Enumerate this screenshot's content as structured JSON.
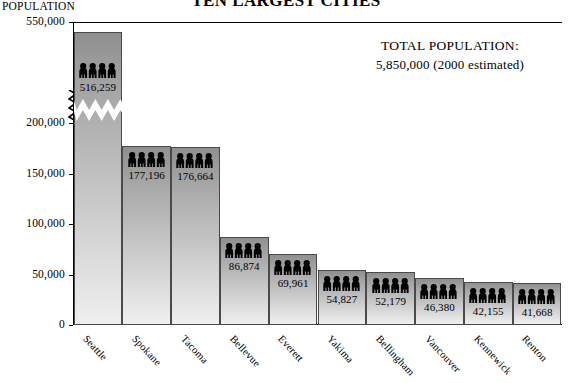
{
  "title": "TEN LARGEST CITIES",
  "axis_title": "POPULATION",
  "callout": {
    "line1": "TOTAL POPULATION:",
    "line2": "5,850,000   (2000 estimated)"
  },
  "icon": {
    "bar_icon_name": "people-group-icon",
    "people_per_bar": 4
  },
  "chart_data": {
    "type": "bar",
    "title": "TEN LARGEST CITIES",
    "xlabel": "",
    "ylabel": "POPULATION",
    "categories": [
      "Seattle",
      "Spokane",
      "Tacoma",
      "Bellevue",
      "Everett",
      "Yakima",
      "Bellingham",
      "Vancouver",
      "Kennewick",
      "Renton"
    ],
    "values": [
      516259,
      177196,
      176664,
      86874,
      69961,
      54827,
      52179,
      46380,
      42155,
      41668
    ],
    "value_labels": [
      "516,259",
      "177,196",
      "176,664",
      "86,874",
      "69,961",
      "54,827",
      "52,179",
      "46,380",
      "42,155",
      "41,668"
    ],
    "ytick_labels": [
      "550,000",
      "200,000",
      "150,000",
      "100,000",
      "50,000",
      "0"
    ],
    "ytick_values": [
      550000,
      200000,
      150000,
      100000,
      50000,
      0
    ],
    "ylim": [
      0,
      550000
    ],
    "axis_break": "between 200,000 and 550,000",
    "grid": false,
    "legend": "none",
    "total_population": 5850000,
    "total_population_label": "5,850,000",
    "year_note": "(2000 estimated)"
  },
  "colors": {
    "bar_top": "#8f8f8f",
    "bar_bottom": "#efefef",
    "bar_border": "#4a4a4a",
    "axis": "#000000",
    "text": "#000000",
    "background": "#ffffff"
  }
}
